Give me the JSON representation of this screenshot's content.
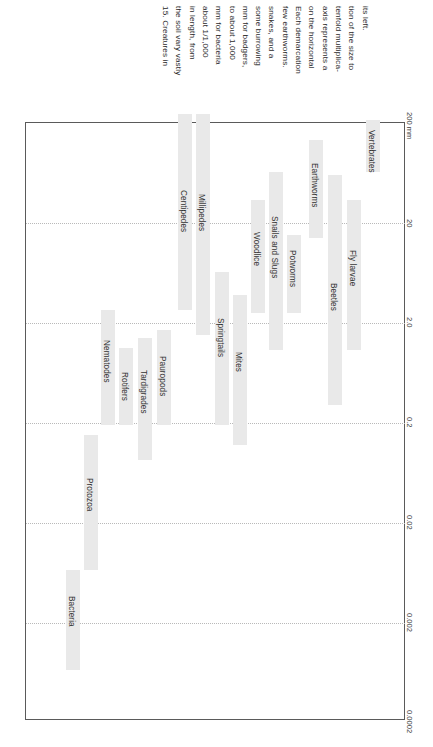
{
  "caption": {
    "lines": [
      "15. Creatures in",
      "the soil vary vastly",
      "in length, from",
      "about 1/1,000",
      "mm for bacteria",
      "to about 1,000",
      "mm for badgers,",
      "some burrowing",
      "snakes, and a",
      "few earthworms.",
      "Each demarcation",
      "on the horizontal",
      "axis represents a",
      "tenfold multiplica-",
      "tion of the size to",
      "its left."
    ],
    "full_text": "15. Creatures in the soil vary vastly in length, from about 1/1,000 mm for bacteria to about 1,000 mm for badgers, some burrowing snakes, and a few earthworms. Each demarcation on the horizontal axis represents a tenfold multiplication of the size to its left."
  },
  "colors": {
    "bar_fill": "#e9e9e9",
    "frame": "#5a5a5a",
    "gridline": "#b9b9b9",
    "label_text": "#333333"
  },
  "chart_data": {
    "type": "bar",
    "title": "",
    "xlabel": "",
    "ylabel": "Length",
    "orientation": "vertical-ranges",
    "grid": true,
    "axis_unit": "mm",
    "axis_ticks": [
      "200 mm",
      "20",
      "2.0",
      "0.2",
      "0.02",
      "0.002",
      "0.0002"
    ],
    "axis_tick_values": [
      200,
      20,
      2.0,
      0.2,
      0.02,
      0.002,
      0.0002
    ],
    "axis_note": "log scale, each demarcation is a tenfold multiplication",
    "categories": [
      "Bacteria",
      "Protozoa",
      "Nematodes",
      "Rotifers",
      "Tardigrades",
      "Pauropods",
      "Centipedes",
      "Millipedes",
      "Springtails",
      "Mites",
      "Woodlice",
      "Snails and Slugs",
      "Potworms",
      "Earthworms",
      "Beetles",
      "Fly larvae",
      "Vertebrates"
    ],
    "ranges_mm": [
      {
        "name": "Bacteria",
        "min": 0.0004,
        "max": 0.006
      },
      {
        "name": "Protozoa",
        "min": 0.005,
        "max": 0.7
      },
      {
        "name": "Nematodes",
        "min": 0.13,
        "max": 8.0
      },
      {
        "name": "Rotifers",
        "min": 0.13,
        "max": 1.2
      },
      {
        "name": "Tardigrades",
        "min": 0.045,
        "max": 1.7
      },
      {
        "name": "Pauropods",
        "min": 0.13,
        "max": 2.4
      },
      {
        "name": "Centipedes",
        "min": 8.0,
        "max": 300
      },
      {
        "name": "Millipedes",
        "min": 3.8,
        "max": 300
      },
      {
        "name": "Springtails",
        "min": 0.13,
        "max": 6.0
      },
      {
        "name": "Mites",
        "min": 0.07,
        "max": 3.8
      },
      {
        "name": "Woodlice",
        "min": 7.5,
        "max": 50
      },
      {
        "name": "Snails and Slugs",
        "min": 2.8,
        "max": 110
      },
      {
        "name": "Potworms",
        "min": 7.5,
        "max": 30
      },
      {
        "name": "Earthworms",
        "min": 20,
        "max": 400
      },
      {
        "name": "Beetles",
        "min": 1.0,
        "max": 100
      },
      {
        "name": "Fly larvae",
        "min": 2.8,
        "max": 50
      },
      {
        "name": "Vertebrates",
        "min": 90,
        "max": 300
      }
    ],
    "bar_geometry_px": [
      {
        "name": "Bacteria",
        "x": 66,
        "w": 14,
        "top": 570,
        "bottom": 670
      },
      {
        "name": "Protozoa",
        "x": 84,
        "w": 14,
        "top": 435,
        "bottom": 570
      },
      {
        "name": "Nematodes",
        "x": 101,
        "w": 14,
        "top": 310,
        "bottom": 425
      },
      {
        "name": "Rotifers",
        "x": 119,
        "w": 14,
        "top": 348,
        "bottom": 425
      },
      {
        "name": "Tardigrades",
        "x": 138,
        "w": 14,
        "top": 338,
        "bottom": 460
      },
      {
        "name": "Pauropods",
        "x": 157,
        "w": 14,
        "top": 330,
        "bottom": 425
      },
      {
        "name": "Centipedes",
        "x": 178,
        "w": 14,
        "top": 114,
        "bottom": 310
      },
      {
        "name": "Millipedes",
        "x": 196,
        "w": 14,
        "top": 114,
        "bottom": 335
      },
      {
        "name": "Springtails",
        "x": 215,
        "w": 14,
        "top": 272,
        "bottom": 425
      },
      {
        "name": "Mites",
        "x": 233,
        "w": 14,
        "top": 295,
        "bottom": 445
      },
      {
        "name": "Woodlice",
        "x": 251,
        "w": 14,
        "top": 200,
        "bottom": 313
      },
      {
        "name": "Snails and Slugs",
        "x": 269,
        "w": 14,
        "top": 172,
        "bottom": 350
      },
      {
        "name": "Potworms",
        "x": 287,
        "w": 14,
        "top": 235,
        "bottom": 313
      },
      {
        "name": "Earthworms",
        "x": 309,
        "w": 14,
        "top": 140,
        "bottom": 238
      },
      {
        "name": "Beetles",
        "x": 328,
        "w": 14,
        "top": 175,
        "bottom": 405
      },
      {
        "name": "Fly larvae",
        "x": 347,
        "w": 14,
        "top": 200,
        "bottom": 350
      },
      {
        "name": "Vertebrates",
        "x": 366,
        "w": 14,
        "top": 120,
        "bottom": 172
      }
    ],
    "label_offsets_px": [
      {
        "name": "Bacteria",
        "label_y": 596
      },
      {
        "name": "Protozoa",
        "label_y": 478
      },
      {
        "name": "Nematodes",
        "label_y": 340
      },
      {
        "name": "Rotifers",
        "label_y": 372
      },
      {
        "name": "Tardigrades",
        "label_y": 370
      },
      {
        "name": "Pauropods",
        "label_y": 356
      },
      {
        "name": "Centipedes",
        "label_y": 190
      },
      {
        "name": "Millipedes",
        "label_y": 194
      },
      {
        "name": "Springtails",
        "label_y": 318
      },
      {
        "name": "Mites",
        "label_y": 352
      },
      {
        "name": "Woodlice",
        "label_y": 232
      },
      {
        "name": "Snails and Slugs",
        "label_y": 216
      },
      {
        "name": "Potworms",
        "label_y": 250
      },
      {
        "name": "Earthworms",
        "label_y": 163
      },
      {
        "name": "Beetles",
        "label_y": 283
      },
      {
        "name": "Fly larvae",
        "label_y": 250
      },
      {
        "name": "Vertebrates",
        "label_y": 130
      }
    ],
    "gridlines_px": [
      223,
      323,
      423,
      523,
      623
    ],
    "tick_positions_px": [
      {
        "label": "200 mm",
        "y": 124
      },
      {
        "label": "20",
        "y": 223
      },
      {
        "label": "2.0",
        "y": 323
      },
      {
        "label": "0.2",
        "y": 423
      },
      {
        "label": "0.02",
        "y": 523
      },
      {
        "label": "0.002",
        "y": 623
      },
      {
        "label": "0.0002",
        "y": 722
      }
    ]
  }
}
